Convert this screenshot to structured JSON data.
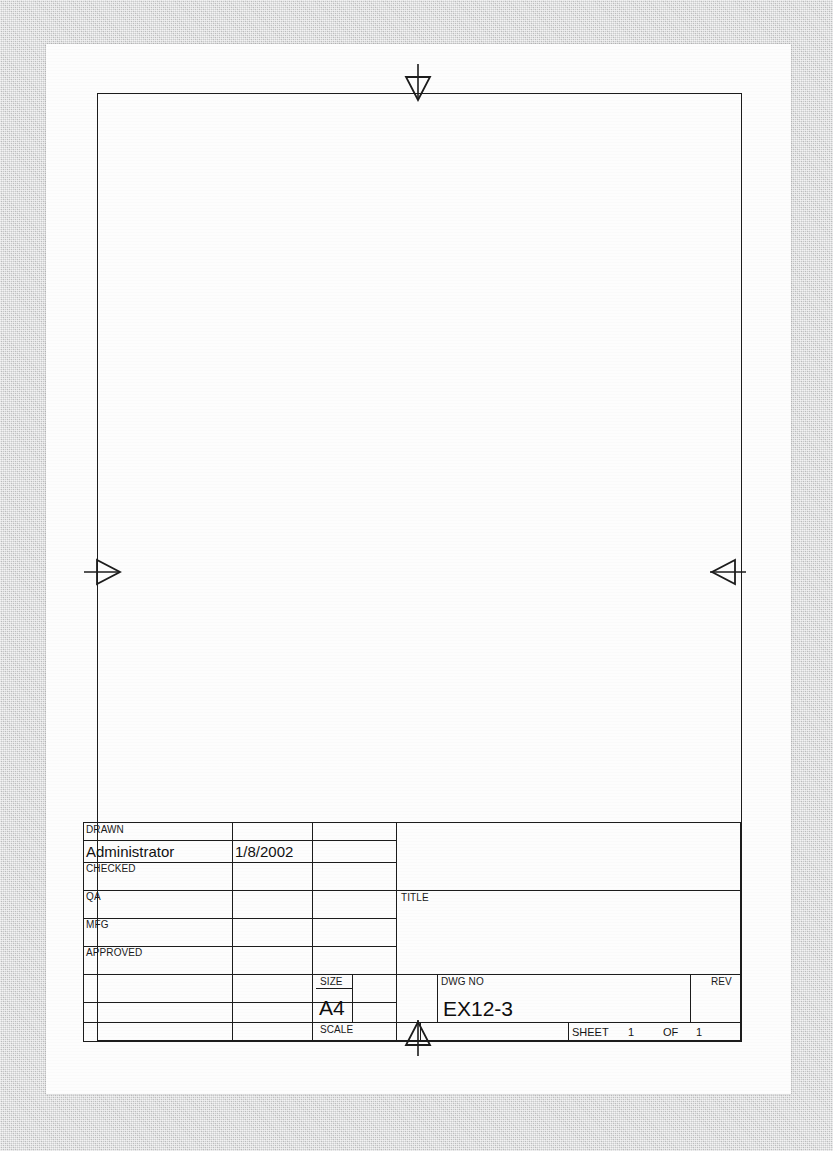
{
  "document": {
    "type": "engineering-drawing-title-block",
    "sheet_size_label": "A4",
    "background_color": "#c9cacb",
    "paper_color": "#fdfdfd",
    "line_color": "#1c1c1c"
  },
  "centering_marks": {
    "top": "arrow-down",
    "bottom": "arrow-up",
    "left": "arrow-right",
    "right": "arrow-left"
  },
  "title_block": {
    "approval_rows": [
      {
        "label": "DRAWN",
        "name": "Administrator",
        "date": "1/8/2002"
      },
      {
        "label": "CHECKED",
        "name": "",
        "date": ""
      },
      {
        "label": "QA",
        "name": "",
        "date": ""
      },
      {
        "label": "MFG",
        "name": "",
        "date": ""
      },
      {
        "label": "APPROVED",
        "name": "",
        "date": ""
      },
      {
        "label": "",
        "name": "",
        "date": ""
      },
      {
        "label": "",
        "name": "",
        "date": ""
      }
    ],
    "company_block": "",
    "title": {
      "label": "TITLE",
      "value": ""
    },
    "size": {
      "label": "SIZE",
      "value": "A4"
    },
    "code_block": "",
    "dwg_no": {
      "label": "DWG NO",
      "value": "EX12-3"
    },
    "rev": {
      "label": "REV",
      "value": ""
    },
    "scale": {
      "label": "SCALE",
      "value": ""
    },
    "sheet": {
      "label": "SHEET",
      "number": "1",
      "of_label": "OF",
      "total": "1"
    }
  }
}
